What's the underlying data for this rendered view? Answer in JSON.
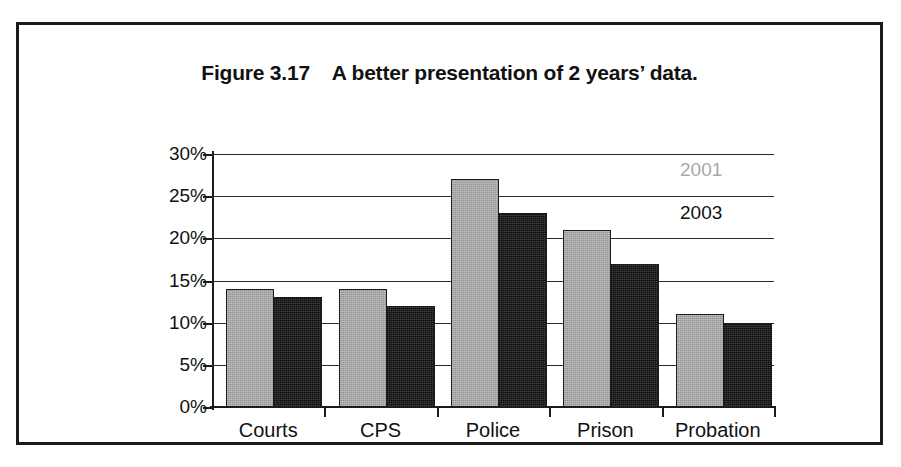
{
  "figure": {
    "title": "Figure 3.17    A better presentation of 2 years’ data."
  },
  "chart_data": {
    "type": "bar",
    "title": "Figure 3.17    A better presentation of 2 years’ data.",
    "xlabel": "",
    "ylabel": "",
    "categories": [
      "Courts",
      "CPS",
      "Police",
      "Prison",
      "Probation"
    ],
    "series": [
      {
        "name": "2001",
        "color": "#a8a8a8",
        "values": [
          14,
          14,
          27,
          21,
          11
        ]
      },
      {
        "name": "2003",
        "color": "#161616",
        "values": [
          13,
          12,
          23,
          17,
          10
        ]
      }
    ],
    "ylim": [
      0,
      30
    ],
    "ytick_values": [
      0,
      5,
      10,
      15,
      20,
      25,
      30
    ],
    "ytick_labels": [
      "0%",
      "5%",
      "10%",
      "15%",
      "20%",
      "25%",
      "30%"
    ],
    "value_unit": "%",
    "grid": true,
    "grid_axis": "y",
    "legend": "direct-labels-right",
    "legend_entries": [
      {
        "label": "2001",
        "color": "#a9a9a9"
      },
      {
        "label": "2003",
        "color": "#111111"
      }
    ]
  }
}
